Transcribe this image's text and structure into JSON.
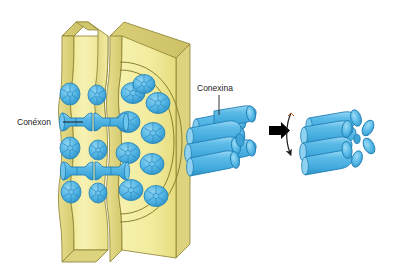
{
  "figure": {
    "background_color": "#ffffff"
  },
  "colors": {
    "membrane_face": "#f5efa0",
    "membrane_face_light": "#faf7c8",
    "membrane_edge": "#e3d98a",
    "membrane_shadow": "#d8cd73",
    "outline": "#8a7f2e",
    "connexin_blue": "#4fb4e3",
    "connexin_blue_light": "#7fcbee",
    "connexin_blue_dark": "#2e96cc",
    "connexin_outline": "#1f7fb5",
    "arrow_black": "#000000",
    "rotation_arrow": "#1a1a1a",
    "label_text": "#1d1d1d",
    "leader_line": "#1d1d1d"
  },
  "labels": {
    "connexon": {
      "text": "Conéxon",
      "x": 17,
      "y": 125,
      "leader_from_x": 63,
      "leader_to_x": 83,
      "leader_y": 122
    },
    "connexina": {
      "text": "Conexina",
      "x": 197,
      "y": 91,
      "leader_x": 219,
      "leader_from_y": 95,
      "leader_to_y": 113
    }
  },
  "panels": [
    {
      "name": "gap-junction-membranes",
      "description": "Two adjacent plasma membranes joined by paired connexons",
      "x": 55,
      "y": 14,
      "width": 145,
      "height": 255
    },
    {
      "name": "connexon-open",
      "description": "Connexon hemichannel composed of six connexin subunits, open conformation",
      "x": 185,
      "y": 105,
      "width": 82,
      "height": 75,
      "subunit_count": 6
    },
    {
      "name": "connexon-closed",
      "description": "Connexon after subunit rotation, closed conformation",
      "x": 300,
      "y": 105,
      "width": 80,
      "height": 75,
      "subunit_count": 6
    }
  ],
  "arrows": {
    "transition": {
      "name": "transition-arrow",
      "direction": "right",
      "x": 271,
      "y": 130
    },
    "rotation": {
      "name": "rotation-arrow",
      "direction": "clockwise-down",
      "x": 289,
      "y": 112
    }
  },
  "connexon_pairs": [
    {
      "name": "connexon-pair-upper",
      "y": 122
    },
    {
      "name": "connexon-pair-lower",
      "y": 160
    }
  ],
  "en_face_connexons": {
    "name": "en-face-connexon-rosettes",
    "count": 13,
    "subunits_per_rosette": 6
  }
}
